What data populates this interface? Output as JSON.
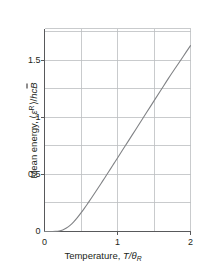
{
  "figure": {
    "background_color": "#ffffff",
    "axis_color": "#58595b",
    "grid_color": "#bcbec0",
    "curve_color": "#808285",
    "text_color": "#231f20"
  },
  "axes": {
    "x_label_parts": {
      "name": "Temperature, ",
      "symbol_numerator": "T",
      "slash": "/",
      "symbol_denominator": "θ",
      "denominator_subscript": "R"
    },
    "y_label_parts": {
      "name": "Mean energy, ",
      "open_bracket": "⟨",
      "epsilon": "ε",
      "epsilon_superscript": "R",
      "close_bracket": "⟩",
      "slash": "/",
      "hc": "hc",
      "B_tilde": "B"
    },
    "x_ticks": [
      {
        "value": 0,
        "label": "0"
      },
      {
        "value": 1,
        "label": "1"
      },
      {
        "value": 2,
        "label": "2"
      }
    ],
    "y_ticks": [
      {
        "value": 0,
        "label": "0"
      },
      {
        "value": 0.5,
        "label": "0.5"
      },
      {
        "value": 1,
        "label": "1"
      },
      {
        "value": 1.5,
        "label": "1.5"
      }
    ],
    "x_gridlines": [
      0.5,
      1.0,
      1.5
    ],
    "y_gridlines": [
      0.25,
      0.5,
      0.75,
      1.0,
      1.25,
      1.5,
      1.75
    ],
    "xlim": [
      0,
      2
    ],
    "ylim": [
      0,
      1.78
    ]
  },
  "chart_data": {
    "type": "line",
    "title": "",
    "xlabel": "Temperature, T/θR",
    "ylabel": "Mean energy, ⟨εR⟩/hcB̃",
    "xlim": [
      0,
      2
    ],
    "ylim": [
      0,
      1.78
    ],
    "grid": true,
    "legend": "none",
    "series": [
      {
        "name": "Rotational mean energy",
        "color": "#808285",
        "x": [
          0.0,
          0.05,
          0.1,
          0.15,
          0.2,
          0.25,
          0.3,
          0.35,
          0.4,
          0.45,
          0.5,
          0.55,
          0.6,
          0.65,
          0.7,
          0.75,
          0.8,
          0.85,
          0.9,
          0.95,
          1.0,
          1.1,
          1.2,
          1.3,
          1.4,
          1.5,
          1.6,
          1.7,
          1.8,
          1.9,
          2.0
        ],
        "y": [
          0.0,
          0.0,
          0.0,
          0.001,
          0.005,
          0.014,
          0.03,
          0.054,
          0.085,
          0.122,
          0.163,
          0.207,
          0.253,
          0.3,
          0.348,
          0.397,
          0.446,
          0.495,
          0.545,
          0.595,
          0.645,
          0.745,
          0.845,
          0.945,
          1.045,
          1.145,
          1.245,
          1.345,
          1.44,
          1.535,
          1.63
        ]
      }
    ]
  }
}
